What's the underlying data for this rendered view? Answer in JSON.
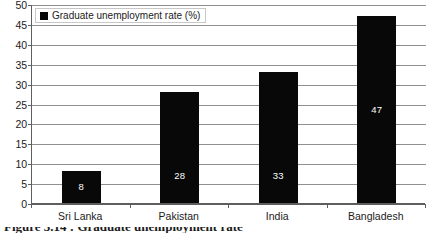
{
  "chart_data": {
    "type": "bar",
    "title": "",
    "subtitle": "",
    "xlabel": "",
    "ylabel": "",
    "categories": [
      "Sri Lanka",
      "Pakistan",
      "India",
      "Bangladesh"
    ],
    "values": [
      8,
      28,
      33,
      47
    ],
    "bar_top_values": [
      8,
      28,
      33,
      47
    ],
    "data_labels": [
      "8",
      "28",
      "33",
      "47"
    ],
    "series": [
      {
        "name": "Graduate unemployment rate (%)",
        "values": [
          8,
          28,
          33,
          47
        ],
        "color": "#080808"
      }
    ],
    "ylim": [
      0,
      50
    ],
    "ytick_step": 5,
    "ytick_labels": [
      "50",
      "45",
      "40",
      "35",
      "30",
      "25",
      "20",
      "15",
      "10",
      "5",
      "0"
    ],
    "grid": true,
    "grid_axis": "y",
    "grid_color": "#8f8f8f",
    "axis_color": "#5e5e5e",
    "legend": {
      "position": "top-left",
      "label": "Graduate unemployment rate (%)",
      "swatch_color": "#080808",
      "border_color": "#c8c8c8"
    },
    "label_color": "#ffffff",
    "background": "#ffffff"
  },
  "caption": {
    "cropped_text": "Figure 3.14 : Graduate unemployment rate"
  }
}
